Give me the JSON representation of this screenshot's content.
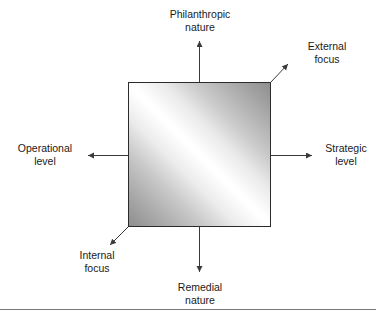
{
  "diagram": {
    "type": "two-axis-quadrant-matrix",
    "axes": [
      {
        "id": "vertical",
        "orientation": "vertical",
        "positive_end": "top",
        "top_label": {
          "line1": "Philanthropic",
          "line2": "nature"
        },
        "bottom_label": {
          "line1": "Remedial",
          "line2": "nature"
        }
      },
      {
        "id": "horizontal",
        "orientation": "horizontal",
        "left_label": {
          "line1": "Operational",
          "line2": "level"
        },
        "right_label": {
          "line1": "Strategic",
          "line2": "level"
        }
      },
      {
        "id": "diagonal",
        "orientation": "diagonal",
        "upper_right_label": {
          "line1": "External",
          "line2": "focus"
        },
        "lower_left_label": {
          "line1": "Internal",
          "line2": "focus"
        }
      }
    ],
    "labels": {
      "philanthropic_nature": {
        "line1": "Philanthropic",
        "line2": "nature"
      },
      "external_focus": {
        "line1": "External",
        "line2": "focus"
      },
      "operational_level": {
        "line1": "Operational",
        "line2": "level"
      },
      "strategic_level": {
        "line1": "Strategic",
        "line2": "level"
      },
      "internal_focus": {
        "line1": "Internal",
        "line2": "focus"
      },
      "remedial_nature": {
        "line1": "Remedial",
        "line2": "nature"
      }
    },
    "square": {
      "fill_description": "linear gradient, white highlight band along the bottom-left to top-right diagonal, grey at the top-left and bottom-right corners",
      "border_color": "#2b2b2b",
      "highlight_color": "#ffffff",
      "shadow_color": "#8e8e8e"
    },
    "colors": {
      "background": "#ffffff",
      "text": "#1a1a1a",
      "arrow": "#3a3a3a",
      "rule": "#7a7a7a"
    }
  }
}
